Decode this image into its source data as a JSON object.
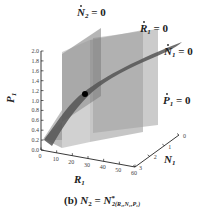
{
  "chart_data": {
    "type": "surface3d",
    "caption": "(b) N₂ = N*₂(R₁,N₁,P₁)",
    "caption_parts": {
      "prefix": "(b) ",
      "lhs": "N",
      "lhs_sub": "2",
      "eq": " = ",
      "rhs": "N",
      "rhs_sup": "*",
      "rhs_sub": "2(R₁,N₁,P₁)"
    },
    "axes": {
      "x": {
        "label": "R",
        "label_sub": "1",
        "ticks": [
          "0",
          "10",
          "20",
          "30",
          "40",
          "50",
          "60"
        ],
        "range": [
          0,
          60
        ]
      },
      "y": {
        "label": "N",
        "label_sub": "1",
        "ticks": [
          "0",
          "1",
          "2",
          "3"
        ],
        "range": [
          0,
          3
        ]
      },
      "z": {
        "label": "P",
        "label_sub": "1",
        "ticks": [
          "0.0",
          "0.2",
          "0.4",
          "0.6",
          "0.8",
          "1.0",
          "1.2",
          "1.4",
          "1.6",
          "1.8",
          "2.0"
        ],
        "range": [
          0,
          2.0
        ]
      }
    },
    "surfaces": [
      {
        "name": "Ṅ₂ = 0",
        "base": "N",
        "sub": "2",
        "rhs": " = 0",
        "kind": "vertical plane",
        "color": "#8a8a8a"
      },
      {
        "name": "Ṙ₁ = 0",
        "base": "R",
        "sub": "1",
        "rhs": " = 0",
        "kind": "vertical plane",
        "color": "#9a9a9a"
      },
      {
        "name": "Ṅ₁ = 0",
        "base": "N",
        "sub": "1",
        "rhs": " = 0",
        "kind": "curved surface",
        "color": "#5a5a5a"
      },
      {
        "name": "Ṗ₁ = 0",
        "base": "P",
        "sub": "1",
        "rhs": " = 0",
        "kind": "vertical plane",
        "color": "#b0b0b0"
      }
    ],
    "equilibrium_point": {
      "label": "intersection",
      "color": "#000000"
    }
  }
}
